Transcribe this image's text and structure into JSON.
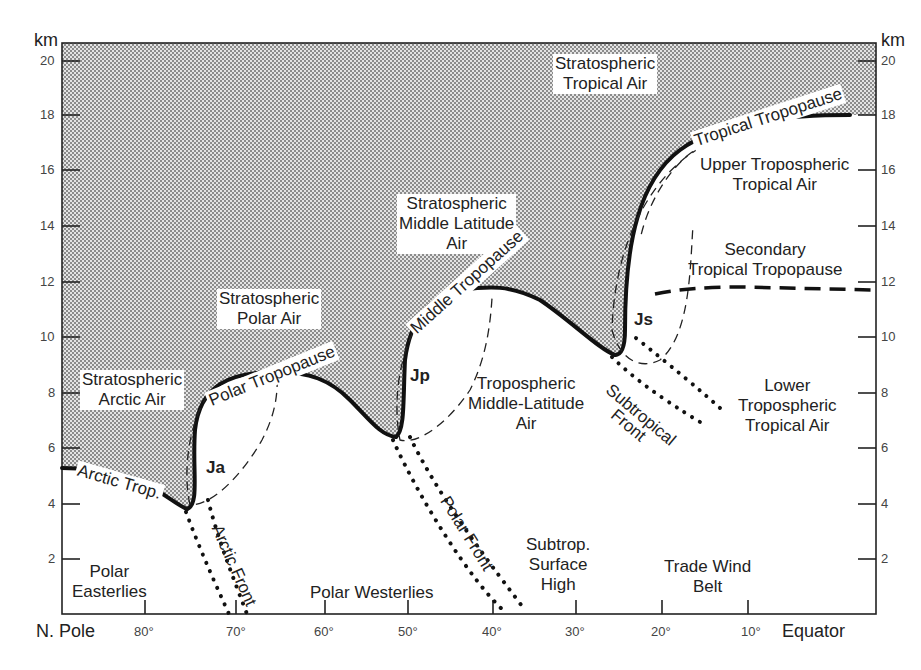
{
  "diagram": {
    "y_axis": {
      "unit": "km",
      "ticks": [
        "20",
        "18",
        "16",
        "14",
        "12",
        "10",
        "8",
        "6",
        "4",
        "2"
      ]
    },
    "x_axis": {
      "left_end": "N. Pole",
      "right_end": "Equator",
      "ticks": [
        "80°",
        "70°",
        "60°",
        "50°",
        "40°",
        "30°",
        "20°",
        "10°"
      ]
    },
    "air_masses": {
      "strat_tropical": [
        "Stratospheric",
        "Tropical Air"
      ],
      "strat_midlat": [
        "Stratospheric",
        "Middle Latitude",
        "Air"
      ],
      "strat_polar": [
        "Stratospheric",
        "Polar Air"
      ],
      "strat_arctic": [
        "Stratospheric",
        "Arctic Air"
      ],
      "upper_trop_tropical": [
        "Upper Tropospheric",
        "Tropical Air"
      ],
      "trop_midlat": [
        "Tropospheric",
        "Middle-Latitude",
        "Air"
      ],
      "lower_trop_tropical": [
        "Lower",
        "Tropospheric",
        "Tropical Air"
      ]
    },
    "tropopauses": {
      "tropical": "Tropical Tropopause",
      "secondary": [
        "Secondary",
        "Tropical Tropopause"
      ],
      "middle": "Middle Tropopause",
      "polar": "Polar Tropopause",
      "arctic": "Arctic Trop."
    },
    "jets": {
      "arctic": "Ja",
      "polar": "Jp",
      "subtropical": "Js"
    },
    "fronts": {
      "arctic": "Arctic Front",
      "polar": "Polar Front",
      "subtropical": [
        "Subtropical",
        "Front"
      ]
    },
    "surface": {
      "polar_easterlies": [
        "Polar",
        "Easterlies"
      ],
      "polar_westerlies": "Polar Westerlies",
      "subtrop_high": [
        "Subtrop.",
        "Surface",
        "High"
      ],
      "trade_wind": [
        "Trade Wind",
        "Belt"
      ]
    },
    "colors": {
      "line": "#111111",
      "stipple_dark": "#8a8a8a",
      "stipple_light": "#e6e6e6",
      "text": "#222222"
    }
  }
}
